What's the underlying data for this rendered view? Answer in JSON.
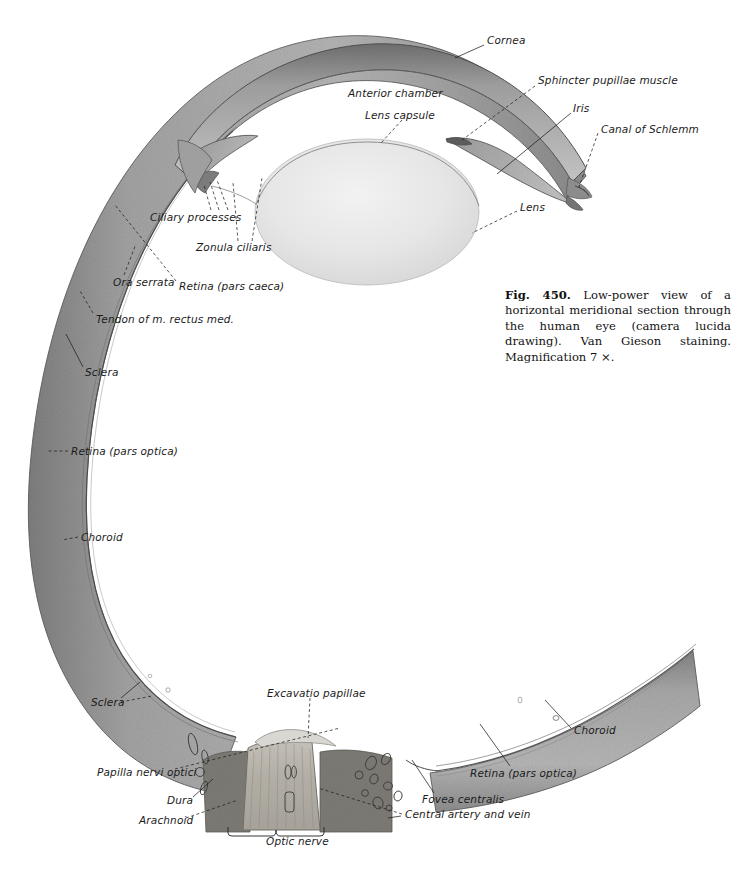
{
  "figure": {
    "domain": "anatomical-illustration",
    "subject": "Horizontal meridional section through the human eye",
    "background_color": "#ffffff",
    "ink_color": "#1b1b1b",
    "tissue_gray": "#9a9a9a",
    "tissue_dark": "#6d6d6d",
    "lens_gray": "#e3e3e3"
  },
  "caption": {
    "figure_number": "Fig. 450.",
    "text": "Low-power view of a horizontal meridional section through the human eye (camera lucida drawing). Van Gieson staining. Magnification 7 ×."
  },
  "labels": [
    {
      "id": "cornea",
      "text": "Cornea",
      "x": 487,
      "y": 41
    },
    {
      "id": "sphincter-pupillae",
      "text": "Sphincter pupillae muscle",
      "x": 538,
      "y": 80
    },
    {
      "id": "anterior-chamber",
      "text": "Anterior chamber",
      "x": 348,
      "y": 93
    },
    {
      "id": "iris",
      "text": "Iris",
      "x": 573,
      "y": 108
    },
    {
      "id": "lens-capsule",
      "text": "Lens capsule",
      "x": 365,
      "y": 114
    },
    {
      "id": "canal-of-schlemm",
      "text": "Canal of Schlemm",
      "x": 601,
      "y": 129
    },
    {
      "id": "lens",
      "text": "Lens",
      "x": 520,
      "y": 207
    },
    {
      "id": "ciliary-processes",
      "text": "Ciliary processes",
      "x": 150,
      "y": 216
    },
    {
      "id": "zonula-ciliaris",
      "text": "Zonula ciliaris",
      "x": 196,
      "y": 246
    },
    {
      "id": "ora-serrata",
      "text": "Ora serrata",
      "x": 113,
      "y": 281
    },
    {
      "id": "retina-pars-caeca",
      "text": "Retina (pars caeca)",
      "x": 179,
      "y": 285
    },
    {
      "id": "tendon-rectus-med",
      "text": "Tendon of m. rectus med.",
      "x": 96,
      "y": 318
    },
    {
      "id": "sclera-upper",
      "text": "Sclera",
      "x": 85,
      "y": 371
    },
    {
      "id": "retina-pars-optica-left",
      "text": "Retina (pars optica)",
      "x": 71,
      "y": 450
    },
    {
      "id": "choroid-left",
      "text": "Choroid",
      "x": 81,
      "y": 536
    },
    {
      "id": "excavatio-papillae",
      "text": "Excavatio papillae",
      "x": 267,
      "y": 692
    },
    {
      "id": "sclera-lower",
      "text": "Sclera",
      "x": 91,
      "y": 701
    },
    {
      "id": "choroid-right",
      "text": "Choroid",
      "x": 574,
      "y": 729
    },
    {
      "id": "papilla-nervi-optici",
      "text": "Papilla nervi optici",
      "x": 97,
      "y": 771
    },
    {
      "id": "retina-pars-optica-rt",
      "text": "Retina (pars optica)",
      "x": 470,
      "y": 772
    },
    {
      "id": "fovea-centralis",
      "text": "Fovea centralis",
      "x": 422,
      "y": 798
    },
    {
      "id": "dura",
      "text": "Dura",
      "x": 167,
      "y": 799
    },
    {
      "id": "arachnoid",
      "text": "Arachnoid",
      "x": 139,
      "y": 819
    },
    {
      "id": "central-artery-vein",
      "text": "Central artery and vein",
      "x": 405,
      "y": 813
    },
    {
      "id": "optic-nerve",
      "text": "Optic nerve",
      "x": 266,
      "y": 840
    }
  ]
}
